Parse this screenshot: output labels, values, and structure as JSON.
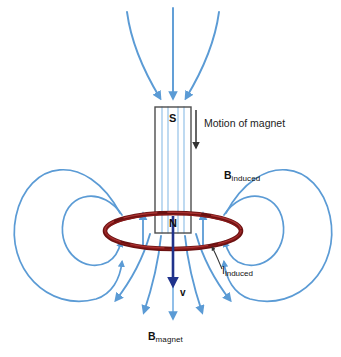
{
  "figure": {
    "background_color": "#ffffff"
  },
  "magnet": {
    "top_pole_label": "S",
    "bottom_pole_label": "N",
    "body_fill": "#ffffff",
    "body_stroke": "#4d4d4d",
    "rect": {
      "x": 155,
      "y": 107,
      "width": 36,
      "height": 126
    }
  },
  "annotations": {
    "motion": {
      "text": "Motion of magnet",
      "arrow_color": "#333333",
      "arrow_direction": "down"
    },
    "b_induced": {
      "symbol": "B",
      "subscript": "induced",
      "color": "#111111"
    },
    "i_induced": {
      "symbol": "I",
      "subscript": "induced",
      "color": "#111111",
      "leader_color": "#333333"
    },
    "b_magnet": {
      "symbol": "B",
      "subscript": "magnet",
      "color": "#111111"
    },
    "velocity": {
      "symbol": "v",
      "color": "#111111",
      "arrow_color": "#20338c",
      "arrow_direction": "down"
    }
  },
  "colors": {
    "field_line": "#5b9bd5",
    "field_line_inner": "#8cbce8",
    "coil_dark": "#6b1111",
    "coil_mid": "#8f1a1a",
    "coil_highlight": "#c24a4a",
    "velocity_arrow": "#20338c",
    "motion_arrow": "#333333",
    "magnet_outline": "#4d4d4d",
    "text": "#111111"
  },
  "legend_notes": {
    "magnet_field_lines": "Magnet field lines (B_magnet) enter the S pole from above and exit the N pole downward",
    "induced_field_lines": "Induced field loops (B_induced) circle the current-carrying coil on both sides",
    "induced_current": "Induced current I_induced flows around the dark red loop"
  }
}
